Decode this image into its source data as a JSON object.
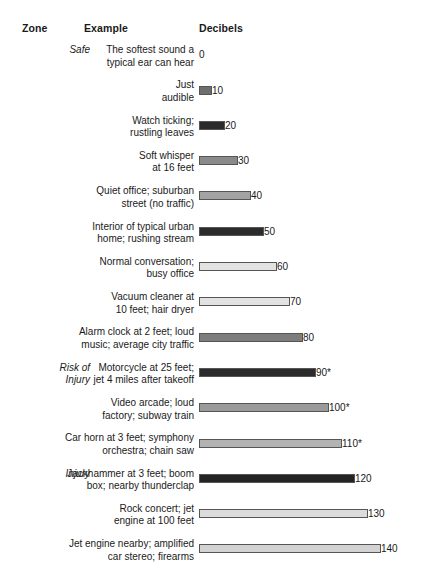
{
  "columns": {
    "zone": "Zone",
    "example": "Example",
    "decibels": "Decibels"
  },
  "chart_data": {
    "type": "bar",
    "title": "",
    "xlabel": "Decibels",
    "ylabel": "Example",
    "categories": [
      "The softest sound a typical ear can hear",
      "Just audible",
      "Watch ticking; rustling leaves",
      "Soft whisper at 16 feet",
      "Quiet office; suburban street (no traffic)",
      "Interior of typical urban home; rushing stream",
      "Normal conversation; busy office",
      "Vacuum cleaner at 10 feet; hair dryer",
      "Alarm clock at 2 feet; loud music; average city traffic",
      "Motorcycle at 25 feet; jet 4 miles after takeoff",
      "Video arcade; loud factory; subway train",
      "Car horn at 3 feet; symphony orchestra; chain saw",
      "Jackhammer at 3 feet; boom box; nearby thunderclap",
      "Rock concert; jet engine at 100 feet",
      "Jet engine nearby; amplified car stereo; firearms"
    ],
    "values": [
      0,
      10,
      20,
      30,
      40,
      50,
      60,
      70,
      80,
      90,
      100,
      110,
      120,
      130,
      140
    ],
    "xlim": [
      0,
      140
    ],
    "grid": false,
    "legend": false,
    "zones": [
      "Safe",
      "Risk of Injury",
      "Injury"
    ]
  },
  "rows": [
    {
      "zone": "Safe",
      "example": "The softest sound a\ntypical ear can hear",
      "value": 0,
      "label": "0",
      "bar_width": 0,
      "color": "#ffffff"
    },
    {
      "zone": "",
      "example": "Just\naudible",
      "value": 10,
      "label": "10",
      "bar_width": 13,
      "color": "#6e6e6e"
    },
    {
      "zone": "",
      "example": "Watch ticking;\nrustling leaves",
      "value": 20,
      "label": "20",
      "bar_width": 26,
      "color": "#2b2b2b"
    },
    {
      "zone": "",
      "example": "Soft whisper\nat 16 feet",
      "value": 30,
      "label": "30",
      "bar_width": 39,
      "color": "#8a8a8a"
    },
    {
      "zone": "",
      "example": "Quiet office; suburban\nstreet (no traffic)",
      "value": 40,
      "label": "40",
      "bar_width": 52,
      "color": "#a3a3a3"
    },
    {
      "zone": "",
      "example": "Interior of typical urban\nhome; rushing stream",
      "value": 50,
      "label": "50",
      "bar_width": 65,
      "color": "#2b2b2b"
    },
    {
      "zone": "",
      "example": "Normal conversation;\nbusy office",
      "value": 60,
      "label": "60",
      "bar_width": 78,
      "color": "#e2e2e2"
    },
    {
      "zone": "",
      "example": "Vacuum cleaner at\n10 feet; hair dryer",
      "value": 70,
      "label": "70",
      "bar_width": 91,
      "color": "#e2e2e2"
    },
    {
      "zone": "",
      "example": "Alarm clock at 2 feet; loud\nmusic; average city traffic",
      "value": 80,
      "label": "80",
      "bar_width": 104,
      "color": "#7d7d7d"
    },
    {
      "zone": "Risk of\nInjury",
      "example": "Motorcycle at 25 feet;\njet 4 miles after takeoff",
      "value": 90,
      "label": "90*",
      "bar_width": 117,
      "color": "#2b2b2b"
    },
    {
      "zone": "",
      "example": "Video arcade; loud\nfactory; subway train",
      "value": 100,
      "label": "100*",
      "bar_width": 130,
      "color": "#9a9a9a"
    },
    {
      "zone": "",
      "example": "Car horn at 3 feet; symphony\norchestra; chain saw",
      "value": 110,
      "label": "110*",
      "bar_width": 143,
      "color": "#b3b3b3"
    },
    {
      "zone": "Injury",
      "example": "Jackhammer at 3 feet; boom\nbox; nearby thunderclap",
      "value": 120,
      "label": "120",
      "bar_width": 156,
      "color": "#242424"
    },
    {
      "zone": "",
      "example": "Rock concert; jet\nengine at 100 feet",
      "value": 130,
      "label": "130",
      "bar_width": 169,
      "color": "#dcdcdc"
    },
    {
      "zone": "",
      "example": "Jet engine nearby; amplified\ncar stereo; firearms",
      "value": 140,
      "label": "140",
      "bar_width": 182,
      "color": "#d2d2d2"
    }
  ]
}
